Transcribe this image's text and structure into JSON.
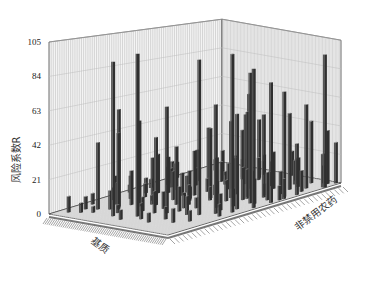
{
  "chart_data": {
    "type": "bar3d",
    "title": "",
    "zlabel": "风险系数R",
    "xlabel": "基质",
    "ylabel": "非禁用农药",
    "zlim": [
      0,
      105
    ],
    "z_ticks": [
      0,
      21,
      42,
      63,
      84,
      105
    ],
    "grid": true,
    "n_matrix": 40,
    "n_pesticide": 60,
    "note": "Values estimated from a dense 3D bar chart; most cells are empty (R≈0). Listed bars are [matrix_index, pesticide_index, R].",
    "bars": [
      [
        2,
        4,
        10
      ],
      [
        3,
        8,
        6
      ],
      [
        4,
        12,
        4
      ],
      [
        5,
        6,
        8
      ],
      [
        6,
        20,
        5
      ],
      [
        7,
        14,
        12
      ],
      [
        8,
        3,
        7
      ],
      [
        9,
        26,
        9
      ],
      [
        10,
        10,
        18
      ],
      [
        10,
        11,
        14
      ],
      [
        11,
        16,
        22
      ],
      [
        12,
        5,
        8
      ],
      [
        12,
        30,
        11
      ],
      [
        13,
        22,
        6
      ],
      [
        14,
        9,
        15
      ],
      [
        15,
        18,
        28
      ],
      [
        15,
        40,
        7
      ],
      [
        16,
        12,
        9
      ],
      [
        16,
        34,
        13
      ],
      [
        17,
        2,
        5
      ],
      [
        17,
        24,
        19
      ],
      [
        18,
        8,
        10
      ],
      [
        18,
        44,
        16
      ],
      [
        19,
        28,
        8
      ],
      [
        19,
        50,
        12
      ],
      [
        20,
        15,
        24
      ],
      [
        20,
        36,
        9
      ],
      [
        21,
        4,
        6
      ],
      [
        21,
        42,
        14
      ],
      [
        22,
        20,
        11
      ],
      [
        22,
        54,
        17
      ],
      [
        23,
        32,
        7
      ],
      [
        23,
        10,
        13
      ],
      [
        24,
        46,
        20
      ],
      [
        24,
        26,
        9
      ],
      [
        25,
        6,
        15
      ],
      [
        25,
        38,
        25
      ],
      [
        26,
        16,
        12
      ],
      [
        26,
        58,
        10
      ],
      [
        27,
        30,
        18
      ],
      [
        27,
        48,
        8
      ],
      [
        28,
        12,
        22
      ],
      [
        28,
        40,
        14
      ],
      [
        29,
        24,
        9
      ],
      [
        29,
        52,
        16
      ],
      [
        30,
        34,
        12
      ],
      [
        30,
        8,
        19
      ],
      [
        31,
        44,
        26
      ],
      [
        31,
        18,
        7
      ],
      [
        32,
        56,
        15
      ],
      [
        32,
        28,
        11
      ],
      [
        33,
        14,
        18
      ],
      [
        33,
        38,
        9
      ],
      [
        34,
        50,
        21
      ],
      [
        34,
        22,
        13
      ],
      [
        35,
        6,
        8
      ],
      [
        35,
        46,
        17
      ],
      [
        36,
        32,
        12
      ],
      [
        36,
        58,
        24
      ],
      [
        37,
        26,
        10
      ],
      [
        37,
        42,
        15
      ],
      [
        38,
        10,
        9
      ],
      [
        38,
        54,
        13
      ],
      [
        39,
        36,
        18
      ],
      [
        4,
        40,
        6
      ],
      [
        6,
        48,
        9
      ],
      [
        8,
        52,
        7
      ],
      [
        11,
        44,
        12
      ],
      [
        13,
        56,
        8
      ],
      [
        14,
        36,
        10
      ],
      [
        16,
        50,
        11
      ],
      [
        9,
        32,
        14
      ],
      [
        12,
        38,
        16
      ],
      [
        7,
        42,
        8
      ],
      [
        5,
        34,
        10
      ],
      [
        3,
        28,
        6
      ],
      [
        18,
        30,
        20
      ],
      [
        20,
        22,
        15
      ],
      [
        22,
        14,
        18
      ],
      [
        24,
        6,
        12
      ],
      [
        26,
        4,
        9
      ],
      [
        28,
        2,
        11
      ],
      [
        30,
        20,
        14
      ],
      [
        32,
        40,
        10
      ],
      [
        34,
        30,
        16
      ],
      [
        36,
        20,
        11
      ],
      [
        38,
        24,
        13
      ],
      [
        19,
        12,
        26
      ],
      [
        21,
        26,
        30
      ],
      [
        23,
        46,
        22
      ],
      [
        25,
        54,
        19
      ],
      [
        27,
        58,
        14
      ],
      [
        17,
        46,
        33
      ],
      [
        15,
        30,
        38
      ],
      [
        13,
        24,
        44
      ],
      [
        11,
        20,
        55
      ],
      [
        9,
        14,
        62
      ],
      [
        21,
        34,
        47
      ],
      [
        23,
        40,
        52
      ],
      [
        25,
        44,
        58
      ],
      [
        27,
        20,
        40
      ],
      [
        29,
        36,
        66
      ],
      [
        31,
        30,
        49
      ],
      [
        33,
        24,
        35
      ],
      [
        35,
        28,
        42
      ],
      [
        37,
        50,
        45
      ],
      [
        39,
        58,
        30
      ],
      [
        6,
        10,
        42
      ],
      [
        8,
        16,
        48
      ],
      [
        4,
        22,
        96
      ],
      [
        6,
        30,
        102
      ],
      [
        10,
        36,
        68
      ],
      [
        12,
        48,
        100
      ],
      [
        16,
        56,
        104
      ],
      [
        20,
        58,
        93
      ],
      [
        22,
        52,
        88
      ],
      [
        26,
        50,
        57
      ],
      [
        30,
        58,
        36
      ],
      [
        14,
        52,
        71
      ],
      [
        18,
        54,
        63
      ],
      [
        24,
        58,
        82
      ],
      [
        36,
        59,
        96
      ],
      [
        38,
        56,
        39
      ],
      [
        34,
        54,
        60
      ],
      [
        28,
        56,
        73
      ],
      [
        32,
        50,
        54
      ]
    ]
  },
  "axes": {
    "z_tick_labels": [
      "0",
      "21",
      "42",
      "63",
      "84",
      "105"
    ],
    "z_title": "风险系数R",
    "x_title": "基质",
    "y_title": "非禁用农药"
  },
  "colors": {
    "wall_fill": "#f4f4f4",
    "wall_grid": "#9a9a9a",
    "floor_fill": "#c8c8c8",
    "bar_front": "#555555",
    "bar_side": "#2f2f2f",
    "bar_top": "#8a8a8a",
    "axis_line": "#444444"
  }
}
